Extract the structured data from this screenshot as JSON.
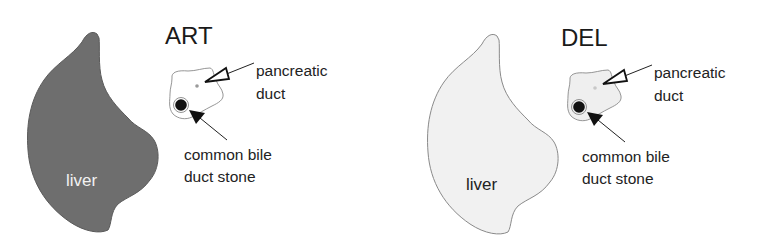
{
  "panels": [
    {
      "id": "art",
      "title": "ART",
      "liver": {
        "label": "liver",
        "fill": "#6e6e6e",
        "stroke": "#5a5a5a",
        "label_color": "#f2f2f2"
      },
      "pancreas": {
        "fill": "#ffffff",
        "stroke": "#8a8a8a"
      },
      "pancreatic_duct": {
        "dot_color": "#9a9a9a",
        "label_line1": "pancreatic",
        "label_line2": "duct",
        "arrow": "open-triangle"
      },
      "stone": {
        "color": "#111111",
        "label_line1": "common bile",
        "label_line2": "duct stone",
        "arrow": "filled-triangle"
      }
    },
    {
      "id": "del",
      "title": "DEL",
      "liver": {
        "label": "liver",
        "fill": "#f1f1f1",
        "stroke": "#8a8a8a",
        "label_color": "#222222"
      },
      "pancreas": {
        "fill": "#efefef",
        "stroke": "#8a8a8a"
      },
      "pancreatic_duct": {
        "dot_color": "#c8c8c8",
        "label_line1": "pancreatic",
        "label_line2": "duct",
        "arrow": "open-triangle"
      },
      "stone": {
        "color": "#111111",
        "label_line1": "common bile",
        "label_line2": "duct stone",
        "arrow": "filled-triangle"
      }
    }
  ]
}
